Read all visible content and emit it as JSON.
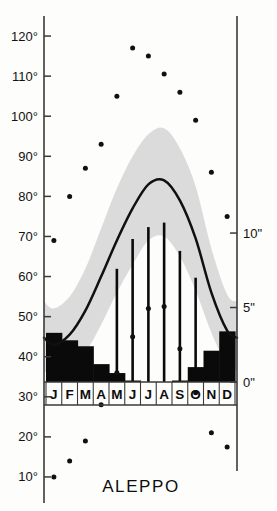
{
  "title": "ALEPPO",
  "chart_data": {
    "type": "line",
    "title": "ALEPPO",
    "subtitle": "",
    "xlabel": "",
    "ylabel": "",
    "categories": [
      "J",
      "F",
      "M",
      "A",
      "M",
      "J",
      "J",
      "A",
      "S",
      "O",
      "N",
      "D"
    ],
    "month_labels": [
      "J",
      "F",
      "M",
      "A",
      "M",
      "J",
      "J",
      "A",
      "S",
      "O",
      "N",
      "D"
    ],
    "temperature_axis": {
      "label": "",
      "unit": "°F",
      "ylim": [
        5,
        125
      ],
      "ticks": [
        10,
        20,
        30,
        40,
        50,
        60,
        70,
        80,
        90,
        100,
        110,
        120
      ],
      "tick_labels": [
        "10°",
        "20°",
        "30°",
        "40°",
        "50°",
        "60°",
        "70°",
        "80°",
        "90°",
        "100°",
        "110°",
        "120°"
      ],
      "grid": false
    },
    "precipitation_axis": {
      "label": "",
      "unit": "\"",
      "ylim": [
        0,
        13
      ],
      "ticks": [
        0,
        5,
        10
      ],
      "tick_labels": [
        "0\"",
        "5\"",
        "10\""
      ],
      "grid": false
    },
    "series": [
      {
        "name": "mean temperature",
        "type": "line",
        "style": "solid-black-curve",
        "values": [
          43.0,
          45.5,
          51.5,
          60.0,
          69.0,
          77.0,
          83.0,
          84.0,
          79.0,
          69.5,
          56.0,
          46.5
        ]
      },
      {
        "name": "daily maximum temperature",
        "type": "band-upper",
        "style": "gray-envelope",
        "values": [
          52.0,
          55.0,
          62.0,
          72.0,
          82.0,
          90.0,
          95.5,
          97.0,
          92.0,
          82.5,
          67.0,
          55.5
        ]
      },
      {
        "name": "daily minimum temperature",
        "type": "band-lower",
        "style": "gray-envelope",
        "values": [
          35.0,
          36.5,
          41.0,
          48.0,
          56.0,
          63.0,
          69.0,
          70.0,
          65.0,
          56.5,
          46.0,
          38.0
        ]
      },
      {
        "name": "monthly precipitation",
        "type": "bar",
        "style": "black-filled-bar",
        "unit": "inches",
        "values": [
          3.3,
          2.8,
          2.4,
          1.2,
          0.6,
          0.1,
          0.0,
          0.0,
          0.1,
          1.0,
          2.1,
          3.4
        ]
      },
      {
        "name": "record high temperature",
        "type": "scatter",
        "style": "black-dot",
        "values": [
          69.0,
          80.0,
          87.0,
          93.0,
          105.0,
          117.0,
          115.0,
          110.5,
          106.0,
          99.0,
          86.0,
          75.0
        ]
      },
      {
        "name": "record low temperature",
        "type": "scatter",
        "style": "black-dot",
        "values": [
          10.0,
          14.0,
          19.0,
          28.0,
          36.0,
          45.0,
          52.0,
          52.5,
          42.0,
          31.0,
          21.0,
          17.5
        ]
      },
      {
        "name": "monthly sunshine marker",
        "type": "stem",
        "style": "thin-vertical-line",
        "values": [
          null,
          null,
          null,
          null,
          7.6,
          9.6,
          10.4,
          10.7,
          8.8,
          7.0,
          null,
          null
        ]
      }
    ],
    "colors": {
      "curve": "#101010",
      "band": "#d9d9d9",
      "bar": "#0a0a0a",
      "dot": "#101010",
      "axis": "#3a3a3a",
      "background": "#fdfdfb"
    }
  }
}
